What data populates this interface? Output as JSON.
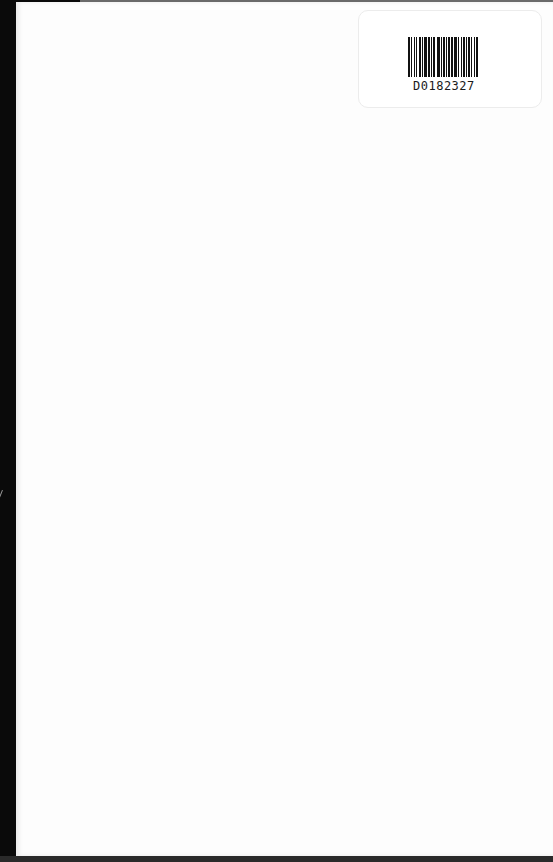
{
  "document": {
    "type": "scanned book endpaper",
    "page_color": "#fdfdfd",
    "background_color": "#0a0a0a"
  },
  "label": {
    "barcode_number": "D0182327",
    "barcode_pattern": [
      2,
      1,
      1,
      2,
      1,
      1,
      1,
      2,
      2,
      1,
      1,
      1,
      3,
      1,
      2,
      1,
      1,
      1,
      2,
      2,
      3,
      1,
      1,
      1,
      2,
      1,
      1,
      1,
      2,
      1,
      2,
      1,
      3,
      1,
      1,
      2,
      1,
      1,
      2,
      1,
      1,
      1,
      2,
      1,
      1,
      2,
      1,
      1,
      2
    ]
  }
}
